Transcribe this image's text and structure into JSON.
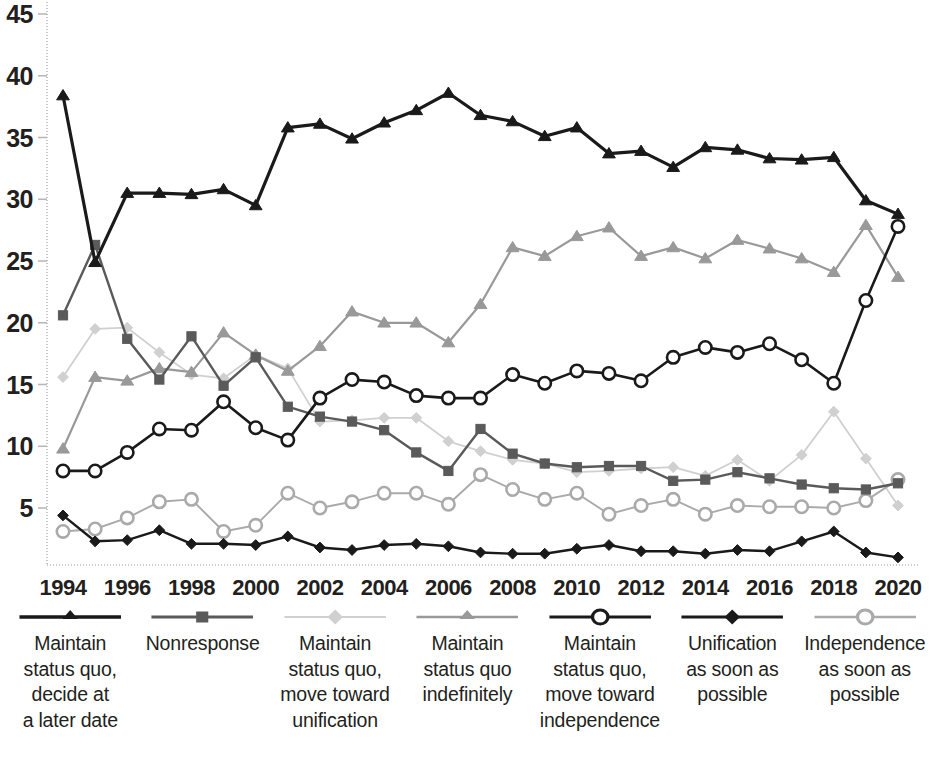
{
  "chart_data": {
    "type": "line",
    "title": "",
    "subtitle": "",
    "xlabel": "",
    "ylabel": "",
    "xlim": [
      1994,
      2020
    ],
    "ylim": [
      0,
      46
    ],
    "yticks": [
      5,
      10,
      15,
      20,
      25,
      30,
      35,
      40,
      45
    ],
    "xticks": [
      1994,
      1996,
      1998,
      2000,
      2002,
      2004,
      2006,
      2008,
      2010,
      2012,
      2014,
      2016,
      2018,
      2020
    ],
    "x": [
      1994,
      1995,
      1996,
      1997,
      1998,
      1999,
      2000,
      2001,
      2002,
      2003,
      2004,
      2005,
      2006,
      2007,
      2008,
      2009,
      2010,
      2011,
      2012,
      2013,
      2014,
      2015,
      2016,
      2017,
      2018,
      2019,
      2020
    ],
    "grid": false,
    "legend_position": "bottom",
    "series": [
      {
        "name": "Maintain status quo, decide at a later date",
        "marker": "triangle",
        "color": "#1a1a1a",
        "line_width": 3.2,
        "values": [
          38.4,
          24.9,
          30.5,
          30.5,
          30.4,
          30.8,
          29.5,
          35.8,
          36.1,
          34.9,
          36.2,
          37.2,
          38.6,
          36.8,
          36.3,
          35.1,
          35.8,
          33.7,
          33.9,
          32.6,
          34.2,
          34.0,
          33.3,
          33.2,
          33.4,
          29.9,
          28.8
        ]
      },
      {
        "name": "Nonresponse",
        "marker": "square",
        "color": "#5a5a5a",
        "line_width": 2.4,
        "values": [
          20.6,
          26.3,
          18.7,
          15.4,
          18.9,
          14.9,
          17.2,
          13.2,
          12.4,
          12.0,
          11.3,
          9.5,
          8.0,
          11.4,
          9.4,
          8.6,
          8.3,
          8.4,
          8.4,
          7.2,
          7.3,
          7.9,
          7.4,
          6.9,
          6.6,
          6.5,
          7.0
        ]
      },
      {
        "name": "Maintain status quo, move toward unification",
        "marker": "diamond",
        "color": "#d0d0d0",
        "line_width": 1.8,
        "values": [
          15.6,
          19.5,
          19.6,
          17.6,
          15.8,
          15.5,
          17.4,
          16.3,
          12.0,
          12.1,
          12.3,
          12.3,
          10.4,
          9.6,
          8.9,
          8.6,
          7.9,
          8.0,
          8.2,
          8.3,
          7.6,
          8.9,
          7.2,
          9.3,
          12.8,
          9.0,
          5.2
        ]
      },
      {
        "name": "Maintain status quo indefinitely",
        "marker": "triangle",
        "color": "#999999",
        "line_width": 2.2,
        "values": [
          9.8,
          15.6,
          15.3,
          16.3,
          16.0,
          19.2,
          17.4,
          16.1,
          18.1,
          20.9,
          20.0,
          20.0,
          18.4,
          21.5,
          26.1,
          25.4,
          27.0,
          27.7,
          25.4,
          26.1,
          25.2,
          26.7,
          26.0,
          25.2,
          24.1,
          27.9,
          23.7
        ]
      },
      {
        "name": "Maintain status quo, move toward independence",
        "marker": "circle-open",
        "color": "#1a1a1a",
        "line_width": 2.6,
        "values": [
          8.0,
          8.0,
          9.5,
          11.4,
          11.3,
          13.6,
          11.5,
          10.5,
          13.9,
          15.4,
          15.2,
          14.1,
          13.9,
          13.9,
          15.8,
          15.1,
          16.1,
          15.9,
          15.3,
          17.2,
          18.0,
          17.6,
          18.3,
          17.0,
          15.1,
          21.8,
          27.8
        ]
      },
      {
        "name": "Unification as soon as possible",
        "marker": "diamond",
        "color": "#1a1a1a",
        "line_width": 2.4,
        "values": [
          4.4,
          2.3,
          2.4,
          3.2,
          2.1,
          2.1,
          2.0,
          2.7,
          1.8,
          1.6,
          2.0,
          2.1,
          1.9,
          1.4,
          1.3,
          1.3,
          1.7,
          2.0,
          1.5,
          1.5,
          1.3,
          1.6,
          1.5,
          2.3,
          3.1,
          1.4,
          1.0
        ]
      },
      {
        "name": "Independence as soon as possible",
        "marker": "circle-open",
        "color": "#aaaaaa",
        "line_width": 1.9,
        "values": [
          3.1,
          3.3,
          4.2,
          5.5,
          5.7,
          3.1,
          3.6,
          6.2,
          5.0,
          5.5,
          6.2,
          6.2,
          5.3,
          7.7,
          6.5,
          5.7,
          6.2,
          4.5,
          5.2,
          5.7,
          4.5,
          5.2,
          5.1,
          5.1,
          5.0,
          5.6,
          7.3
        ]
      }
    ]
  },
  "axes": {
    "y_tick_labels": [
      "45",
      "40",
      "35",
      "30",
      "25",
      "20",
      "15",
      "10",
      "5"
    ],
    "x_tick_labels": [
      "1994",
      "1996",
      "1998",
      "2000",
      "2002",
      "2004",
      "2006",
      "2008",
      "2010",
      "2012",
      "2014",
      "2016",
      "2018",
      "2020"
    ]
  },
  "legend": {
    "items": [
      {
        "label": "Maintain\nstatus quo,\ndecide at\na later date",
        "marker": "triangle",
        "color": "#1a1a1a",
        "line_width": 3.2
      },
      {
        "label": "Nonresponse",
        "marker": "square",
        "color": "#5a5a5a",
        "line_width": 2.4
      },
      {
        "label": "Maintain\nstatus quo,\nmove toward\nunification",
        "marker": "diamond",
        "color": "#d0d0d0",
        "line_width": 1.8
      },
      {
        "label": "Maintain\nstatus quo\nindefinitely",
        "marker": "triangle",
        "color": "#999999",
        "line_width": 2.2
      },
      {
        "label": "Maintain\nstatus quo,\nmove toward\nindependence",
        "marker": "circle-open",
        "color": "#1a1a1a",
        "line_width": 2.6
      },
      {
        "label": "Unification\nas soon as\npossible",
        "marker": "diamond",
        "color": "#1a1a1a",
        "line_width": 2.4
      },
      {
        "label": "Independence\nas soon as\npossible",
        "marker": "circle-open",
        "color": "#aaaaaa",
        "line_width": 1.9
      }
    ]
  },
  "colors": {
    "axis": "#b8b8b8",
    "text": "#231f20",
    "background": "#ffffff"
  }
}
